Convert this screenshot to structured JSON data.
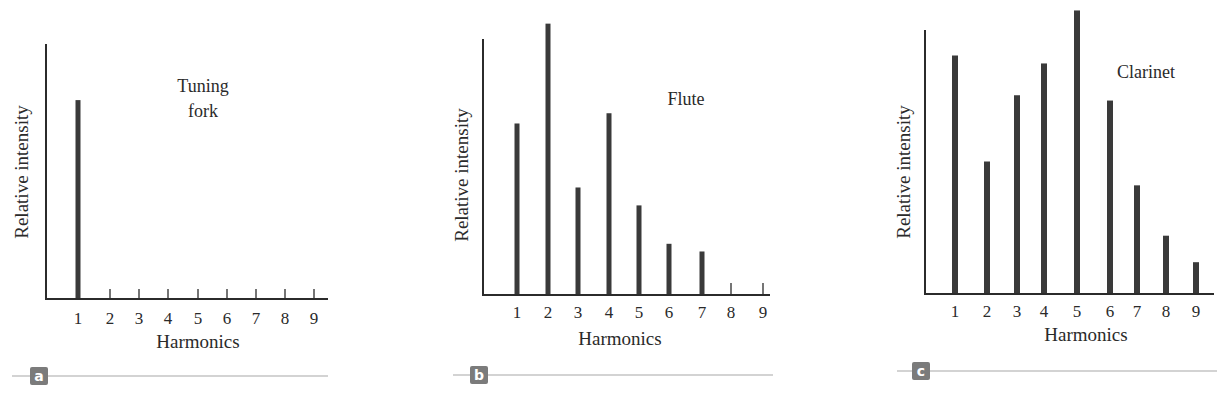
{
  "chart_data": [
    {
      "panel": "a",
      "type": "bar",
      "title": "Tuning fork",
      "title_lines": [
        "Tuning",
        "fork"
      ],
      "xlabel": "Harmonics",
      "ylabel": "Relative intensity",
      "categories": [
        "1",
        "2",
        "3",
        "4",
        "5",
        "6",
        "7",
        "8",
        "9"
      ],
      "values": [
        78,
        0,
        0,
        0,
        0,
        0,
        0,
        0,
        0
      ],
      "ylim": [
        0,
        100
      ],
      "grid": false,
      "legend": null
    },
    {
      "panel": "b",
      "type": "bar",
      "title": "Flute",
      "title_lines": [
        "Flute"
      ],
      "xlabel": "Harmonics",
      "ylabel": "Relative intensity",
      "categories": [
        "1",
        "2",
        "3",
        "4",
        "5",
        "6",
        "7",
        "8",
        "9"
      ],
      "values": [
        67,
        106,
        42,
        71,
        35,
        20,
        17,
        0,
        0
      ],
      "ylim": [
        0,
        100
      ],
      "grid": false,
      "legend": null
    },
    {
      "panel": "c",
      "type": "bar",
      "title": "Clarinet",
      "title_lines": [
        "Clarinet"
      ],
      "xlabel": "Harmonics",
      "ylabel": "Relative intensity",
      "categories": [
        "1",
        "2",
        "3",
        "4",
        "5",
        "6",
        "7",
        "8",
        "9"
      ],
      "values": [
        90,
        50,
        75,
        87,
        107,
        73,
        41,
        22,
        12
      ],
      "ylim": [
        0,
        100
      ],
      "grid": false,
      "legend": null
    }
  ],
  "panels": [
    {
      "badge": "a",
      "title_lines": [
        "Tuning",
        "fork"
      ],
      "xlabel": "Harmonics",
      "ylabel": "Relative intensity",
      "ticks": [
        "1",
        "2",
        "3",
        "4",
        "5",
        "6",
        "7",
        "8",
        "9"
      ]
    },
    {
      "badge": "b",
      "title_lines": [
        "Flute"
      ],
      "xlabel": "Harmonics",
      "ylabel": "Relative intensity",
      "ticks": [
        "1",
        "2",
        "3",
        "4",
        "5",
        "6",
        "7",
        "8",
        "9"
      ]
    },
    {
      "badge": "c",
      "title_lines": [
        "Clarinet"
      ],
      "xlabel": "Harmonics",
      "ylabel": "Relative intensity",
      "ticks": [
        "1",
        "2",
        "3",
        "4",
        "5",
        "6",
        "7",
        "8",
        "9"
      ]
    }
  ],
  "colors": {
    "bar": "#3a3a3a",
    "axis": "#2b2b2b",
    "badge": "#7b7b7b",
    "rule": "#c4c4c4"
  }
}
